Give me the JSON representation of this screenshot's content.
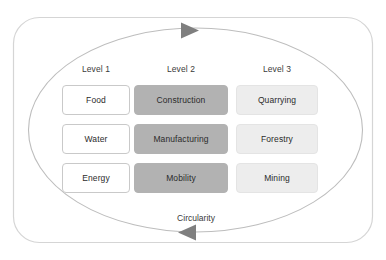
{
  "diagram": {
    "cycle_label": "Circularity",
    "colors": {
      "outer_frame_stroke": "#d5d5d5",
      "cycle_ellipse_stroke": "#b8b8b8",
      "arrow_fill": "#808080",
      "level_1_fill": "#ffffff",
      "level_1_border": "#c9c9c9",
      "level_2_fill": "#b2b2b2",
      "level_3_fill": "#ededed",
      "text": "#2b2b2b",
      "background": "#ffffff"
    },
    "columns": [
      {
        "header": "Level 1",
        "style": "level-1",
        "items": [
          "Food",
          "Water",
          "Energy"
        ]
      },
      {
        "header": "Level 2",
        "style": "level-2",
        "items": [
          "Construction",
          "Manufacturing",
          "Mobility"
        ]
      },
      {
        "header": "Level 3",
        "style": "level-3",
        "items": [
          "Quarrying",
          "Forestry",
          "Mining"
        ]
      }
    ],
    "arrows": [
      {
        "name": "top-arrow",
        "direction": "right"
      },
      {
        "name": "bottom-arrow",
        "direction": "left"
      }
    ]
  }
}
